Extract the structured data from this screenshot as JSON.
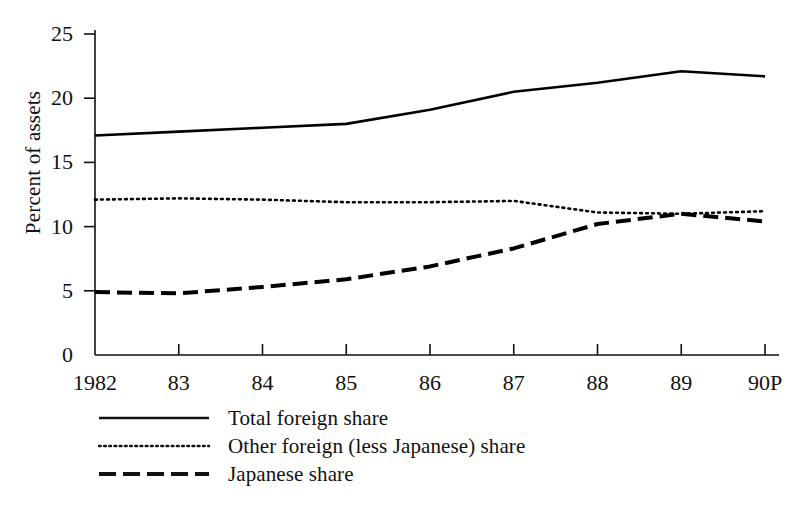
{
  "chart_data": {
    "type": "line",
    "title": "",
    "xlabel": "",
    "ylabel": "Percent of assets",
    "categories": [
      "1982",
      "83",
      "84",
      "85",
      "86",
      "87",
      "88",
      "89",
      "90P"
    ],
    "xtick_labels": [
      "1982",
      "83",
      "84",
      "85",
      "86",
      "87",
      "88",
      "89",
      "90P"
    ],
    "ytick_labels": [
      "0",
      "5",
      "10",
      "15",
      "20",
      "25"
    ],
    "yticks": [
      0,
      5,
      10,
      15,
      20,
      25
    ],
    "ylim": [
      0,
      25
    ],
    "grid": false,
    "legend_position": "below-axes-left",
    "series": [
      {
        "name": "Total foreign share",
        "style": "solid",
        "color": "#000000",
        "values": [
          17.1,
          17.4,
          17.7,
          18.0,
          19.1,
          20.5,
          21.2,
          22.1,
          21.7
        ]
      },
      {
        "name": "Other foreign (less Japanese) share",
        "style": "dotted",
        "color": "#000000",
        "values": [
          12.1,
          12.2,
          12.1,
          11.9,
          11.9,
          12.0,
          11.1,
          11.0,
          11.2
        ]
      },
      {
        "name": "Japanese share",
        "style": "dashed",
        "color": "#000000",
        "values": [
          4.9,
          4.8,
          5.3,
          5.9,
          6.9,
          8.3,
          10.2,
          11.0,
          10.4
        ]
      }
    ]
  },
  "legend": {
    "items": [
      {
        "label": "Total foreign share",
        "style": "solid"
      },
      {
        "label": "Other foreign (less Japanese) share",
        "style": "dotted"
      },
      {
        "label": "Japanese share",
        "style": "dashed"
      }
    ]
  }
}
